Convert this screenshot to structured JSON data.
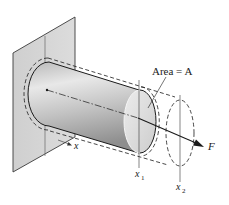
{
  "diagram": {
    "labels": {
      "area": "Area = A",
      "force": "F",
      "x_axis": "x",
      "x1_main": "x",
      "x1_sub": "1",
      "x2_main": "x",
      "x2_sub": "2"
    },
    "elements": [
      {
        "name": "wall",
        "type": "parallelogram"
      },
      {
        "name": "cylinder-bar",
        "type": "solid cylinder"
      },
      {
        "name": "deformed-outline",
        "type": "dashed outline"
      },
      {
        "name": "centerline-axis",
        "type": "dash-dot line"
      },
      {
        "name": "force-arrow",
        "type": "arrow"
      },
      {
        "name": "section-line-x1",
        "type": "vertical line"
      },
      {
        "name": "section-line-x2",
        "type": "vertical line"
      }
    ],
    "colors": {
      "wall_fill": "#d4d4d4",
      "wall_stroke": "#3a3a3a",
      "bar_light": "#e6e6e6",
      "bar_dark": "#9a9a9a",
      "cap_fill": "#dedede",
      "line": "#1a1a1a"
    }
  }
}
